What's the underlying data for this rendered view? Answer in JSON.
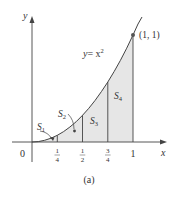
{
  "figure": {
    "caption": "(a)",
    "curve_label_y": "y",
    "curve_label_eq": "= x",
    "curve_label_exp": "2",
    "point_label": "(1, 1)",
    "axis_x_label": "x",
    "axis_y_label": "y",
    "origin_label": "0",
    "ticks": [
      {
        "num": "1",
        "den": "4"
      },
      {
        "num": "1",
        "den": "2"
      },
      {
        "num": "3",
        "den": "4"
      },
      {
        "whole": "1"
      }
    ],
    "regions": [
      {
        "name": "S",
        "sub": "1"
      },
      {
        "name": "S",
        "sub": "2"
      },
      {
        "name": "S",
        "sub": "3"
      },
      {
        "name": "S",
        "sub": "4"
      }
    ],
    "colors": {
      "fill": "#e6e6e6",
      "stroke": "#444444",
      "point": "#555555"
    }
  }
}
